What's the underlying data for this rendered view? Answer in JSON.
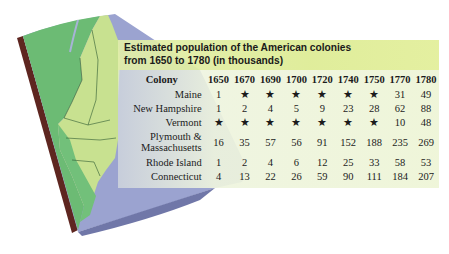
{
  "title": {
    "line1": "Estimated population of the American colonies",
    "line2": "from 1650 to 1780 (in thousands)"
  },
  "table": {
    "headers": [
      "Colony",
      "1650",
      "1670",
      "1690",
      "1700",
      "1720",
      "1740",
      "1750",
      "1770",
      "1780"
    ],
    "rows": [
      {
        "colony": "Maine",
        "values": [
          "1",
          "★",
          "★",
          "★",
          "★",
          "★",
          "★",
          "31",
          "49"
        ]
      },
      {
        "colony": "New Hampshire",
        "values": [
          "1",
          "2",
          "4",
          "5",
          "9",
          "23",
          "28",
          "62",
          "88"
        ]
      },
      {
        "colony": "Vermont",
        "values": [
          "★",
          "★",
          "★",
          "★",
          "★",
          "★",
          "★",
          "10",
          "48"
        ]
      },
      {
        "colony_line1": "Plymouth &",
        "colony_line2": "Massachusetts",
        "values": [
          "16",
          "35",
          "57",
          "56",
          "91",
          "152",
          "188",
          "235",
          "269"
        ]
      },
      {
        "colony": "Rhode Island",
        "values": [
          "1",
          "2",
          "4",
          "6",
          "12",
          "25",
          "33",
          "58",
          "53"
        ]
      },
      {
        "colony": "Connecticut",
        "values": [
          "4",
          "13",
          "22",
          "26",
          "59",
          "90",
          "111",
          "184",
          "207"
        ]
      }
    ]
  },
  "colors": {
    "title_bar": "#dfeb9a",
    "table_bg": "#eef4dc",
    "land_dark": "#6fbf78",
    "land_light": "#c9e38e",
    "ocean": "#9aa3cf",
    "map_edge": "#6b2a22"
  }
}
